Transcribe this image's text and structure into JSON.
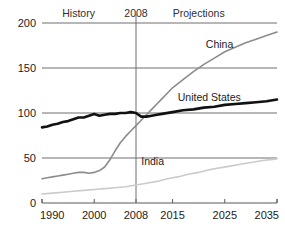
{
  "chart_data": {
    "type": "line",
    "title": "",
    "subtitle": "",
    "xlabel": "",
    "ylabel": "",
    "xlim": [
      1990,
      2035
    ],
    "ylim": [
      0,
      200
    ],
    "grid": true,
    "legend_position": "inline-labels",
    "xticks": [
      "1990",
      "2000",
      "2008",
      "2015",
      "2025",
      "2035"
    ],
    "xtick_values": [
      1990,
      2000,
      2008,
      2015,
      2025,
      2035
    ],
    "yticks": [
      "0",
      "50",
      "100",
      "150",
      "200"
    ],
    "ytick_values": [
      0,
      50,
      100,
      150,
      200
    ],
    "annotations": [
      {
        "name": "history",
        "text": "History",
        "x": 1997,
        "y": 207
      },
      {
        "name": "divider-year",
        "text": "2008",
        "x": 2008,
        "y": 207
      },
      {
        "name": "projections",
        "text": "Projections",
        "x": 2020,
        "y": 207
      }
    ],
    "divider": {
      "x": 2008,
      "label": "2008"
    },
    "series": [
      {
        "name": "China",
        "label": "China",
        "color": "#8c8c8c",
        "width": 1.6,
        "label_x": 2024,
        "label_y": 172,
        "x": [
          1990,
          1991,
          1992,
          1993,
          1994,
          1995,
          1996,
          1997,
          1998,
          1999,
          2000,
          2001,
          2002,
          2003,
          2004,
          2005,
          2006,
          2007,
          2008,
          2009,
          2010,
          2011,
          2012,
          2013,
          2014,
          2015,
          2017,
          2019,
          2021,
          2023,
          2025,
          2027,
          2029,
          2031,
          2033,
          2035
        ],
        "values": [
          27,
          28,
          29,
          30,
          31,
          32,
          33,
          34,
          34,
          33,
          34,
          36,
          40,
          48,
          58,
          67,
          74,
          80,
          86,
          92,
          98,
          104,
          110,
          116,
          122,
          128,
          137,
          146,
          154,
          161,
          168,
          173,
          178,
          182,
          186,
          190
        ]
      },
      {
        "name": "United States",
        "label": "United States",
        "color": "#111111",
        "width": 2.6,
        "label_x": 2016,
        "label_y": 113,
        "x": [
          1990,
          1991,
          1992,
          1993,
          1994,
          1995,
          1996,
          1997,
          1998,
          1999,
          2000,
          2001,
          2002,
          2003,
          2004,
          2005,
          2006,
          2007,
          2008,
          2009,
          2010,
          2011,
          2012,
          2013,
          2015,
          2017,
          2019,
          2021,
          2023,
          2025,
          2027,
          2029,
          2031,
          2033,
          2035
        ],
        "values": [
          84,
          85,
          87,
          88,
          90,
          91,
          93,
          95,
          95,
          97,
          99,
          97,
          98,
          99,
          99,
          100,
          100,
          101,
          100,
          96,
          96,
          97,
          98,
          99,
          101,
          103,
          104,
          106,
          107,
          109,
          110,
          111,
          112,
          113,
          115
        ]
      },
      {
        "name": "India",
        "label": "India",
        "color": "#cbcbcb",
        "width": 1.6,
        "label_x": 2009,
        "label_y": 42,
        "x": [
          1990,
          1992,
          1994,
          1996,
          1998,
          2000,
          2002,
          2004,
          2006,
          2008,
          2010,
          2012,
          2014,
          2016,
          2018,
          2020,
          2022,
          2024,
          2026,
          2028,
          2030,
          2032,
          2035
        ],
        "values": [
          10,
          11,
          12,
          13,
          14,
          15,
          16,
          17,
          18,
          20,
          22,
          24,
          27,
          29,
          32,
          34,
          37,
          39,
          41,
          43,
          45,
          47,
          49
        ]
      }
    ]
  },
  "colors": {
    "axis": "#5a5a5a",
    "grid": "#6e6e6e",
    "divider": "#6e6e6e",
    "text": "#1b1b1b",
    "background": "#ffffff"
  }
}
